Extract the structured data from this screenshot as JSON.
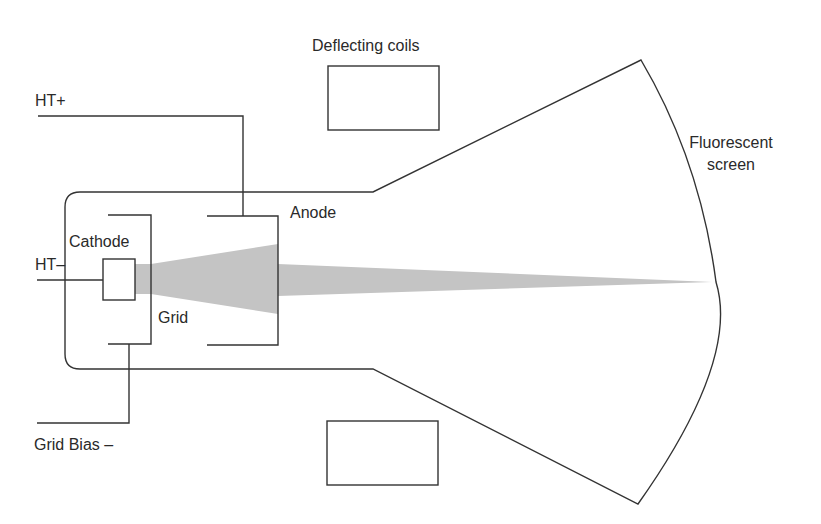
{
  "diagram": {
    "type": "cathode-ray-tube schematic",
    "labels": {
      "deflecting_coils": "Deflecting coils",
      "ht_plus": "HT+",
      "ht_minus": "HT–",
      "cathode": "Cathode",
      "grid": "Grid",
      "anode": "Anode",
      "grid_bias": "Grid Bias –",
      "fluorescent_line1": "Fluorescent",
      "fluorescent_line2": "screen"
    },
    "components": [
      "cathode",
      "grid",
      "anode",
      "deflecting coils (top)",
      "deflecting coils (bottom)",
      "electron beam",
      "fluorescent screen",
      "glass envelope"
    ],
    "colors": {
      "line": "#333333",
      "beam": "#c4c4c4",
      "text": "#2a2a2a",
      "background": "#ffffff"
    }
  }
}
